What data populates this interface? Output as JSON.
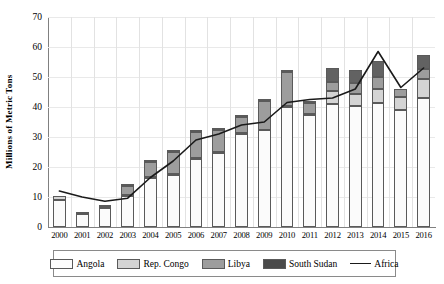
{
  "chart_data": {
    "type": "bar",
    "title": "",
    "xlabel": "",
    "ylabel": "Millions of Metric Tons",
    "ylim": [
      0,
      70
    ],
    "yticks": [
      0,
      10,
      20,
      30,
      40,
      50,
      60,
      70
    ],
    "grid": true,
    "legend_position": "bottom",
    "stacked": true,
    "categories": [
      "2000",
      "2001",
      "2002",
      "2003",
      "2004",
      "2005",
      "2006",
      "2007",
      "2008",
      "2009",
      "2010",
      "2011",
      "2012",
      "2013",
      "2014",
      "2015",
      "2016"
    ],
    "series": [
      {
        "name": "Angola",
        "type": "bar",
        "color": "#fbfbfb",
        "values": [
          9.0,
          4.2,
          6.2,
          10.2,
          16.2,
          17.3,
          22.8,
          24.6,
          31.0,
          32.2,
          40.0,
          37.5,
          41.0,
          40.5,
          41.5,
          39.0,
          43.0
        ]
      },
      {
        "name": "Rep. Congo",
        "type": "bar",
        "color": "#d4d4d4",
        "values": [
          1.3,
          0.3,
          0.5,
          0.4,
          0.4,
          0.4,
          0.3,
          0.4,
          0.4,
          0.3,
          0.3,
          0.3,
          4.5,
          4.0,
          4.5,
          4.5,
          6.5
        ]
      },
      {
        "name": "Libya",
        "type": "bar",
        "color": "#9d9d9d",
        "values": [
          0.0,
          0.0,
          0.0,
          3.0,
          5.2,
          7.2,
          8.5,
          7.4,
          5.4,
          9.5,
          11.5,
          3.5,
          3.0,
          3.5,
          4.0,
          2.5,
          3.2
        ]
      },
      {
        "name": "South Sudan",
        "type": "bar",
        "color": "#626262",
        "values": [
          0.0,
          0.2,
          0.1,
          0.1,
          0.1,
          0.1,
          0.1,
          0.1,
          0.1,
          0.2,
          0.2,
          0.2,
          4.5,
          4.5,
          5.5,
          0.0,
          4.5
        ]
      }
    ],
    "line_series": {
      "name": "Africa",
      "type": "line",
      "color": "#1a1a1a",
      "values": [
        12.0,
        10.0,
        8.6,
        9.6,
        16.5,
        22.0,
        29.0,
        31.0,
        34.0,
        35.0,
        41.5,
        42.5,
        43.0,
        46.0,
        58.5,
        46.5,
        53.0
      ]
    },
    "note": "Africa line is plotted over 17 yearly points 2000-2016"
  },
  "axes": {
    "y_title": "Millions of Metric Tons",
    "y_ticks": [
      "70",
      "60",
      "50",
      "40",
      "30",
      "20",
      "10",
      "0"
    ],
    "x_ticks": [
      "2000",
      "2001",
      "2002",
      "2003",
      "2004",
      "2005",
      "2006",
      "2007",
      "2008",
      "2009",
      "2010",
      "2011",
      "2012",
      "2013",
      "2014",
      "2015",
      "2016"
    ]
  },
  "legend": {
    "items": [
      {
        "label": "Angola",
        "kind": "swatch",
        "swatch_class": "sw-angola"
      },
      {
        "label": "Rep. Congo",
        "kind": "swatch",
        "swatch_class": "sw-congo"
      },
      {
        "label": "Libya",
        "kind": "swatch",
        "swatch_class": "sw-libya"
      },
      {
        "label": "South Sudan",
        "kind": "swatch",
        "swatch_class": "sw-ssudan"
      },
      {
        "label": "Africa",
        "kind": "line",
        "swatch_class": "sw-line"
      }
    ]
  }
}
